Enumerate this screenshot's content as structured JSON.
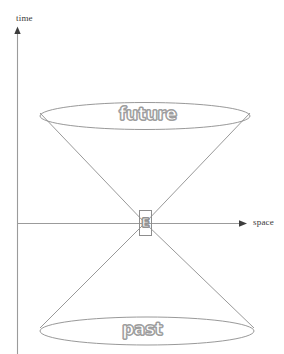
{
  "figure": {
    "kind": "light-cone-spacetime-diagram",
    "background_color": "#ffffff",
    "line_color": "#8d8d8d",
    "axis_color": "#8d8d8d",
    "label_color": "#3a3a3a",
    "outline_text_color": "#9a9a9a",
    "width": 284,
    "height": 354
  },
  "axes": {
    "vertical": {
      "label": "time",
      "origin_x": 17,
      "top_y": 28,
      "bottom_y": 354,
      "arrow": "up"
    },
    "horizontal": {
      "label": "space",
      "origin_y": 223,
      "left_x": 17,
      "right_x": 247,
      "arrow": "right"
    }
  },
  "cones": {
    "apex": {
      "x": 145,
      "y": 223,
      "label": "E"
    },
    "future": {
      "label": "future",
      "ellipse": {
        "cx": 145,
        "cy": 116,
        "rx": 105,
        "ry": 13
      },
      "left_edge": {
        "x": 40,
        "y": 113
      },
      "right_edge": {
        "x": 250,
        "y": 113
      }
    },
    "past": {
      "label": "past",
      "ellipse": {
        "cx": 147,
        "cy": 331,
        "rx": 107,
        "ry": 14
      },
      "left_edge": {
        "x": 40,
        "y": 328
      },
      "right_edge": {
        "x": 254,
        "y": 328
      }
    }
  },
  "watermark": {
    "text": ""
  }
}
